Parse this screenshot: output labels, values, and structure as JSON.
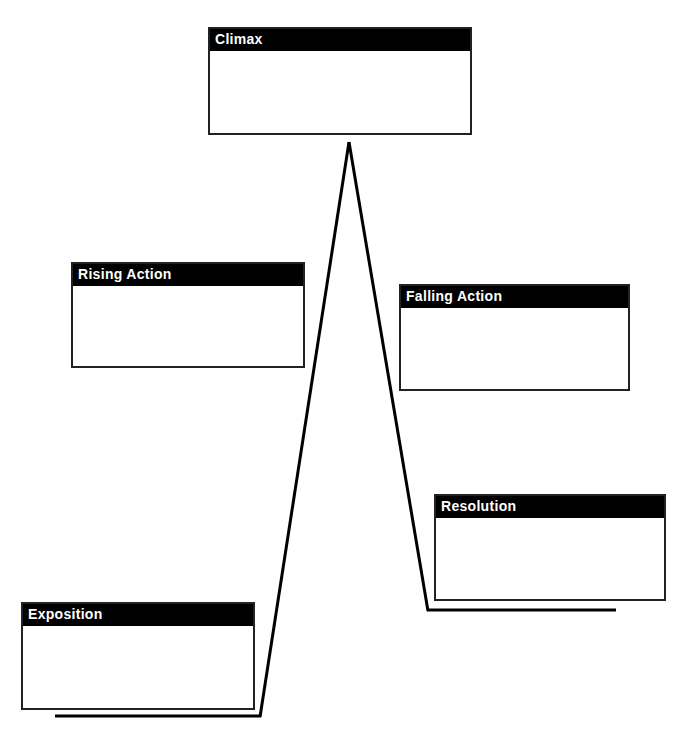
{
  "diagram": {
    "type": "plot-diagram",
    "stages": [
      {
        "key": "climax",
        "label": "Climax",
        "content": ""
      },
      {
        "key": "rising",
        "label": "Rising Action",
        "content": ""
      },
      {
        "key": "falling",
        "label": "Falling Action",
        "content": ""
      },
      {
        "key": "resolution",
        "label": "Resolution",
        "content": ""
      },
      {
        "key": "exposition",
        "label": "Exposition",
        "content": ""
      }
    ],
    "colors": {
      "header_bg": "#000000",
      "header_text": "#ffffff",
      "line": "#000000",
      "border": "#222222"
    }
  }
}
